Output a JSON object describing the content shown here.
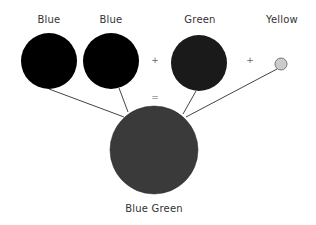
{
  "diagram": {
    "inputs": [
      {
        "label": "Blue",
        "cx": 49,
        "cy": 61,
        "r": 28,
        "fill": "#000000"
      },
      {
        "label": "Blue",
        "cx": 111,
        "cy": 61,
        "r": 28,
        "fill": "#000000"
      },
      {
        "label": "Green",
        "cx": 199,
        "cy": 63,
        "r": 28,
        "fill": "#1a1a1a"
      },
      {
        "label": "Yellow",
        "cx": 281,
        "cy": 64,
        "r": 6,
        "fill": "#cccccc"
      }
    ],
    "operators": [
      "+",
      "+",
      "="
    ],
    "result": {
      "label": "Blue Green",
      "cx": 154,
      "cy": 150,
      "r": 44,
      "fill": "#3a3a3a"
    }
  }
}
